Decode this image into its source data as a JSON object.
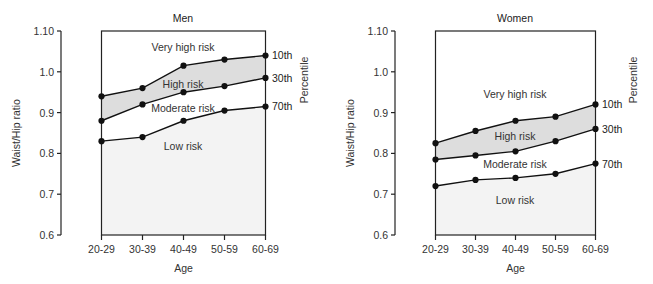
{
  "chart_data": [
    {
      "type": "line",
      "title": "Men",
      "xlabel": "Age",
      "ylabel": "Waist/Hip ratio",
      "right_label": "Percentile",
      "categories": [
        "20-29",
        "30-39",
        "40-49",
        "50-59",
        "60-69"
      ],
      "ylim": [
        0.6,
        1.1
      ],
      "yticks": [
        "0.6",
        "0.7",
        "0.8",
        "0.9",
        "1.0",
        "1.10"
      ],
      "grid": false,
      "series": [
        {
          "name": "10th",
          "values": [
            0.94,
            0.96,
            1.015,
            1.03,
            1.04
          ]
        },
        {
          "name": "30th",
          "values": [
            0.88,
            0.92,
            0.95,
            0.965,
            0.985
          ]
        },
        {
          "name": "70th",
          "values": [
            0.83,
            0.84,
            0.88,
            0.905,
            0.915
          ]
        }
      ],
      "regions": [
        {
          "label": "Very high risk",
          "between": [
            "top",
            "10th"
          ]
        },
        {
          "label": "High risk",
          "between": [
            "10th",
            "30th"
          ],
          "shaded": true
        },
        {
          "label": "Moderate risk",
          "between": [
            "30th",
            "70th"
          ]
        },
        {
          "label": "Low risk",
          "between": [
            "70th",
            "bottom"
          ],
          "shaded": true
        }
      ]
    },
    {
      "type": "line",
      "title": "Women",
      "xlabel": "Age",
      "ylabel": "Waist/Hip ratio",
      "right_label": "Percentile",
      "categories": [
        "20-29",
        "30-39",
        "40-49",
        "50-59",
        "60-69"
      ],
      "ylim": [
        0.6,
        1.1
      ],
      "yticks": [
        "0.6",
        "0.7",
        "0.8",
        "0.9",
        "1.0",
        "1.10"
      ],
      "grid": false,
      "series": [
        {
          "name": "10th",
          "values": [
            0.825,
            0.855,
            0.88,
            0.89,
            0.92
          ]
        },
        {
          "name": "30th",
          "values": [
            0.785,
            0.795,
            0.805,
            0.83,
            0.86
          ]
        },
        {
          "name": "70th",
          "values": [
            0.72,
            0.735,
            0.74,
            0.75,
            0.775
          ]
        }
      ],
      "regions": [
        {
          "label": "Very high risk",
          "between": [
            "top",
            "10th"
          ]
        },
        {
          "label": "High risk",
          "between": [
            "10th",
            "30th"
          ],
          "shaded": true
        },
        {
          "label": "Moderate risk",
          "between": [
            "30th",
            "70th"
          ]
        },
        {
          "label": "Low risk",
          "between": [
            "70th",
            "bottom"
          ],
          "shaded": true
        }
      ]
    }
  ],
  "colors": {
    "line": "#111111",
    "high_risk_fill": "#dddddd",
    "low_risk_fill": "#f3f3f3",
    "axis": "#222222"
  }
}
